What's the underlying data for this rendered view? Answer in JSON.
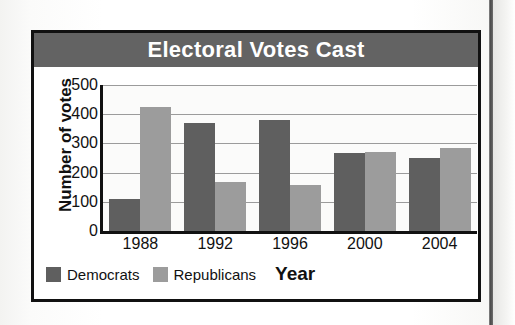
{
  "chart_data": {
    "type": "bar",
    "title": "Electoral Votes Cast",
    "xlabel": "Year",
    "ylabel": "Number of votes",
    "categories": [
      "1988",
      "1992",
      "1996",
      "2000",
      "2004"
    ],
    "yticks": [
      "0",
      "100",
      "200",
      "300",
      "400",
      "500"
    ],
    "ylim": [
      0,
      500
    ],
    "grid": true,
    "legend_position": "bottom-left",
    "series": [
      {
        "name": "Democrats",
        "color": "#5f5f5f",
        "values": [
          111,
          370,
          379,
          266,
          251
        ]
      },
      {
        "name": "Republicans",
        "color": "#9c9c9c",
        "values": [
          426,
          168,
          159,
          271,
          286
        ]
      }
    ]
  },
  "colors": {
    "title_bar": "#636363",
    "title_text": "#ffffff",
    "card_border": "#111111",
    "plot_background": "#fbfbfa",
    "gridline": "#9b9b9b"
  }
}
